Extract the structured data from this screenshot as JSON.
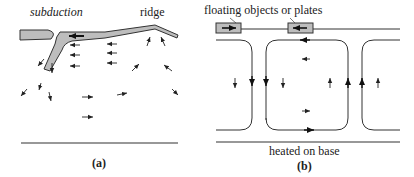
{
  "figure": {
    "panel_a": {
      "caption": "(a)",
      "labels": {
        "subduction": "subduction",
        "ridge": "ridge"
      },
      "colors": {
        "plate_fill": "#bdbdbd",
        "stroke": "#333333"
      }
    },
    "panel_b": {
      "caption": "(b)",
      "labels": {
        "floating": "floating objects or plates",
        "base": "heated on base"
      },
      "colors": {
        "plate_fill": "#bdbdbd",
        "stroke": "#333333"
      }
    }
  }
}
